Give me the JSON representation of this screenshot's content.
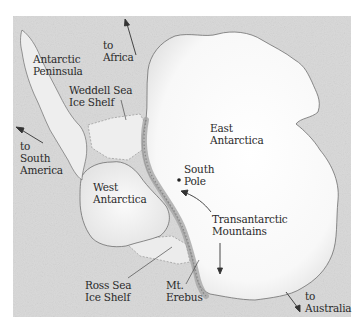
{
  "map": {
    "subject": "Antarctica",
    "colors": {
      "ocean": "#d9d9d9",
      "ocean_texture": "#c9c9c9",
      "land": "#f7f7f7",
      "ice_shelf": "#ececec",
      "coastline": "#6e6e6e",
      "mountains": "#9a9a9a",
      "text": "#2a2a2a",
      "arrow": "#333333"
    },
    "labels": {
      "to_africa": "to\nAfrica",
      "antarctic_peninsula": "Antarctic\nPeninsula",
      "weddell_sea_ice_shelf": "Weddell Sea\nIce Shelf",
      "to_south_america": "to\nSouth\nAmerica",
      "east_antarctica": "East\nAntarctica",
      "south_pole": "South\nPole",
      "west_antarctica": "West\nAntarctica",
      "transantarctic_mountains": "Transantarctic\nMountains",
      "ross_sea_ice_shelf": "Ross Sea\nIce Shelf",
      "mt_erebus": "Mt.\nErebus",
      "to_australia": "to\nAustralia"
    }
  }
}
